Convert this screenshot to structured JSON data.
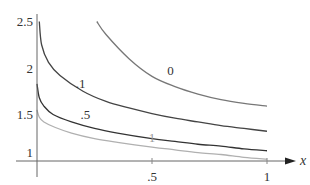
{
  "chart_data": {
    "type": "line",
    "title": "",
    "xlabel": "x",
    "ylabel": "",
    "xlim": [
      0,
      1.1
    ],
    "ylim": [
      0.8,
      2.55
    ],
    "grid": false,
    "legend": "inline curve labels",
    "x_ticks": [
      {
        "value": 0.5,
        "label": ".5"
      },
      {
        "value": 1,
        "label": "1"
      }
    ],
    "y_ticks": [
      {
        "value": 1,
        "label": "1"
      },
      {
        "value": 1.5,
        "label": "1.5"
      },
      {
        "value": 2,
        "label": "2"
      },
      {
        "value": 2.5,
        "label": "2.5"
      }
    ],
    "series": [
      {
        "name": "0",
        "color": "#777777",
        "label_pos": {
          "x": 0.58,
          "y": 1.92
        },
        "points": [
          [
            0.26,
            2.5
          ],
          [
            0.3,
            2.36
          ],
          [
            0.4,
            2.1
          ],
          [
            0.5,
            1.91
          ],
          [
            0.6,
            1.8
          ],
          [
            0.7,
            1.72
          ],
          [
            0.8,
            1.66
          ],
          [
            0.9,
            1.62
          ],
          [
            1.0,
            1.59
          ]
        ]
      },
      {
        "name": ".1",
        "color": "#444444",
        "label_pos": {
          "x": 0.19,
          "y": 1.79
        },
        "points": [
          [
            0.01,
            2.5
          ],
          [
            0.02,
            2.25
          ],
          [
            0.05,
            2.06
          ],
          [
            0.1,
            1.92
          ],
          [
            0.2,
            1.75
          ],
          [
            0.3,
            1.64
          ],
          [
            0.4,
            1.57
          ],
          [
            0.5,
            1.51
          ],
          [
            0.6,
            1.46
          ],
          [
            0.7,
            1.42
          ],
          [
            0.8,
            1.38
          ],
          [
            0.9,
            1.35
          ],
          [
            1.0,
            1.32
          ]
        ]
      },
      {
        "name": ".5",
        "color": "#333333",
        "label_pos": {
          "x": 0.21,
          "y": 1.45
        },
        "points": [
          [
            0.0,
            1.83
          ],
          [
            0.01,
            1.68
          ],
          [
            0.03,
            1.59
          ],
          [
            0.07,
            1.5
          ],
          [
            0.15,
            1.42
          ],
          [
            0.25,
            1.35
          ],
          [
            0.35,
            1.3
          ],
          [
            0.5,
            1.24
          ],
          [
            0.6,
            1.21
          ],
          [
            0.7,
            1.18
          ],
          [
            0.8,
            1.16
          ],
          [
            0.9,
            1.13
          ],
          [
            1.0,
            1.11
          ]
        ]
      },
      {
        "name": "1",
        "color": "#b0b0b0",
        "label_pos": {
          "x": 0.5,
          "y": 1.2
        },
        "points": [
          [
            0.0,
            1.55
          ],
          [
            0.01,
            1.47
          ],
          [
            0.03,
            1.42
          ],
          [
            0.08,
            1.36
          ],
          [
            0.15,
            1.3
          ],
          [
            0.25,
            1.24
          ],
          [
            0.35,
            1.2
          ],
          [
            0.5,
            1.15
          ],
          [
            0.6,
            1.12
          ],
          [
            0.7,
            1.09
          ],
          [
            0.8,
            1.07
          ],
          [
            0.9,
            1.04
          ],
          [
            1.0,
            1.02
          ]
        ]
      }
    ]
  }
}
